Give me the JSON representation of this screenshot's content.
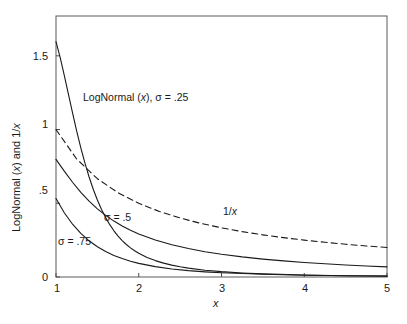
{
  "chart_data": {
    "type": "line",
    "title": "",
    "xlabel": "x",
    "ylabel": "LogNormal (x) and 1/x",
    "xlim": [
      1,
      5
    ],
    "ylim": [
      0,
      1.77
    ],
    "grid": false,
    "legend_position": "inline-annotations",
    "xticks": [
      "1",
      "2",
      "3",
      "4",
      "5"
    ],
    "xtick_values": [
      1,
      2,
      3,
      4,
      5
    ],
    "yticks": [
      "0",
      ".5",
      "1",
      "1.5"
    ],
    "ytick_values": [
      0,
      0.5,
      1,
      1.5
    ],
    "series": [
      {
        "name": "LogNormal (x), σ = .25",
        "style": "solid",
        "color": "#1a1a1a",
        "x": [
          1.0,
          1.05,
          1.1,
          1.15,
          1.2,
          1.25,
          1.3,
          1.35,
          1.4,
          1.45,
          1.5,
          1.55,
          1.6,
          1.65,
          1.7,
          1.75,
          1.8,
          1.85,
          1.9,
          1.95,
          2.0,
          2.1,
          2.2,
          2.3,
          2.4,
          2.5,
          2.6,
          2.8,
          3.0,
          3.25,
          3.5,
          4.0,
          4.5,
          5.0
        ],
        "y": [
          1.5958,
          1.4899,
          1.3681,
          1.24,
          1.1123,
          0.9899,
          0.8758,
          0.7717,
          0.6782,
          0.5952,
          0.5221,
          0.4583,
          0.4028,
          0.3548,
          0.3133,
          0.2776,
          0.2468,
          0.2203,
          0.1974,
          0.1776,
          0.1605,
          0.1328,
          0.1112,
          0.0941,
          0.0804,
          0.0693,
          0.0602,
          0.0462,
          0.0362,
          0.0275,
          0.0213,
          0.0133,
          0.0087,
          0.0059
        ]
      },
      {
        "name": "σ = .5",
        "style": "solid",
        "color": "#1a1a1a",
        "x": [
          1.0,
          1.1,
          1.2,
          1.3,
          1.4,
          1.5,
          1.6,
          1.7,
          1.8,
          1.9,
          2.0,
          2.2,
          2.4,
          2.6,
          2.8,
          3.0,
          3.25,
          3.5,
          3.75,
          4.0,
          4.25,
          4.5,
          4.75,
          5.0
        ],
        "y": [
          0.7979,
          0.7181,
          0.6424,
          0.5742,
          0.5143,
          0.4624,
          0.4177,
          0.3792,
          0.3459,
          0.317,
          0.2919,
          0.2508,
          0.2186,
          0.1928,
          0.1718,
          0.1544,
          0.1364,
          0.1215,
          0.1091,
          0.0986,
          0.0895,
          0.0817,
          0.0749,
          0.0689
        ]
      },
      {
        "name": "σ = .75",
        "style": "solid",
        "color": "#1a1a1a",
        "x": [
          1.0,
          1.1,
          1.2,
          1.3,
          1.4,
          1.5,
          1.6,
          1.7,
          1.8,
          1.9,
          2.0,
          2.2,
          2.4,
          2.6,
          2.8,
          3.0,
          3.5,
          4.0,
          4.5,
          5.0
        ],
        "y": [
          0.5319,
          0.4358,
          0.358,
          0.2955,
          0.2454,
          0.2052,
          0.1728,
          0.1465,
          0.125,
          0.1073,
          0.0926,
          0.0703,
          0.0546,
          0.0433,
          0.0349,
          0.0286,
          0.0182,
          0.0123,
          0.0087,
          0.0063
        ]
      },
      {
        "name": "1/x",
        "style": "dashed",
        "color": "#1a1a1a",
        "x": [
          1.0,
          1.25,
          1.5,
          1.75,
          2.0,
          2.25,
          2.5,
          2.75,
          3.0,
          3.25,
          3.5,
          3.75,
          4.0,
          4.25,
          4.5,
          4.75,
          5.0
        ],
        "y": [
          1.0,
          0.8,
          0.6667,
          0.5714,
          0.5,
          0.4444,
          0.4,
          0.3636,
          0.3333,
          0.3077,
          0.2857,
          0.2667,
          0.25,
          0.2353,
          0.2222,
          0.2105,
          0.2
        ]
      }
    ],
    "annotations": [
      {
        "id": "lognormal-sigma-025",
        "text_prefix": "LogNormal (",
        "text_italic": "x",
        "text_suffix": "), σ = .25"
      },
      {
        "id": "sigma-05",
        "text": "σ = .5"
      },
      {
        "id": "sigma-075",
        "text": "σ = .75"
      },
      {
        "id": "one-over-x",
        "text_prefix": "1/",
        "text_italic": "x",
        "text_suffix": ""
      }
    ]
  },
  "axes": {
    "x_title": "x",
    "y_title_prefix": "LogNormal (",
    "y_title_italic": "x",
    "y_title_suffix": ") and 1/",
    "y_title_italic2": "x",
    "x_tick_labels": [
      "1",
      "2",
      "3",
      "4",
      "5"
    ],
    "y_tick_labels": [
      "0",
      ".5",
      "1",
      "1.5"
    ]
  },
  "colors": {
    "background": "#ffffff",
    "axis": "#4d4d4d",
    "curve": "#1a1a1a"
  }
}
